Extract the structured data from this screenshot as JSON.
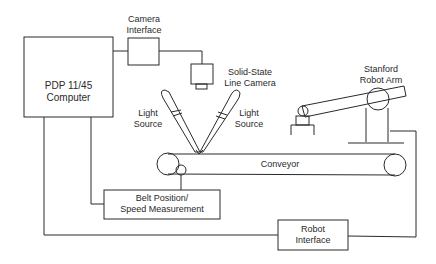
{
  "diagram": {
    "nodes": {
      "computer": "PDP 11/45\nComputer",
      "camera_interface": "Camera\nInterface",
      "line_camera": "Solid-State\nLine Camera",
      "light_source_left": "Light\nSource",
      "light_source_right": "Light\nSource",
      "robot_arm": "Stanford\nRobot Arm",
      "conveyor": "Conveyor",
      "belt_measurement": "Belt Position/\nSpeed Measurement",
      "robot_interface": "Robot\nInterface"
    },
    "edges": [
      {
        "from": "computer",
        "to": "camera_interface"
      },
      {
        "from": "camera_interface",
        "to": "line_camera"
      },
      {
        "from": "computer",
        "to": "belt_measurement"
      },
      {
        "from": "belt_measurement",
        "to": "conveyor"
      },
      {
        "from": "computer",
        "to": "robot_interface"
      },
      {
        "from": "robot_interface",
        "to": "robot_arm"
      }
    ],
    "colors": {
      "line": "#2a2a2a",
      "background": "#ffffff"
    }
  }
}
